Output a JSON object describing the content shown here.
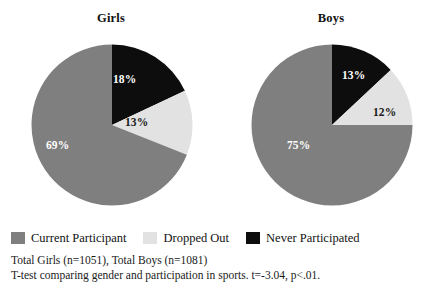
{
  "chart_data": [
    {
      "type": "pie",
      "title": "Girls",
      "categories": [
        "Never Participated",
        "Dropped Out",
        "Current Participant"
      ],
      "values": [
        18,
        13,
        69
      ],
      "labels": [
        "18%",
        "13%",
        "69%"
      ],
      "colors": [
        "#0d0d0d",
        "#e2e2e2",
        "#7f7f7f"
      ],
      "start_angle_deg": 0,
      "direction": "clockwise",
      "n": 1051
    },
    {
      "type": "pie",
      "title": "Boys",
      "categories": [
        "Never Participated",
        "Dropped Out",
        "Current Participant"
      ],
      "values": [
        13,
        12,
        75
      ],
      "labels": [
        "13%",
        "12%",
        "75%"
      ],
      "colors": [
        "#0d0d0d",
        "#e2e2e2",
        "#7f7f7f"
      ],
      "start_angle_deg": 0,
      "direction": "clockwise",
      "n": 1081
    }
  ],
  "girls": {
    "title": "Girls",
    "slices": {
      "never": "18%",
      "dropped": "13%",
      "current": "69%"
    }
  },
  "boys": {
    "title": "Boys",
    "slices": {
      "never": "13%",
      "dropped": "12%",
      "current": "75%"
    }
  },
  "legend": {
    "items": [
      {
        "label": "Current Participant",
        "color": "#7f7f7f"
      },
      {
        "label": "Dropped Out",
        "color": "#e2e2e2"
      },
      {
        "label": "Never Participated",
        "color": "#0d0d0d"
      }
    ]
  },
  "footnotes": {
    "totals": "Total Girls (n=1051), Total Boys (n=1081)",
    "ttest": "T-test comparing gender and participation in sports. t=-3.04, p<.01."
  }
}
